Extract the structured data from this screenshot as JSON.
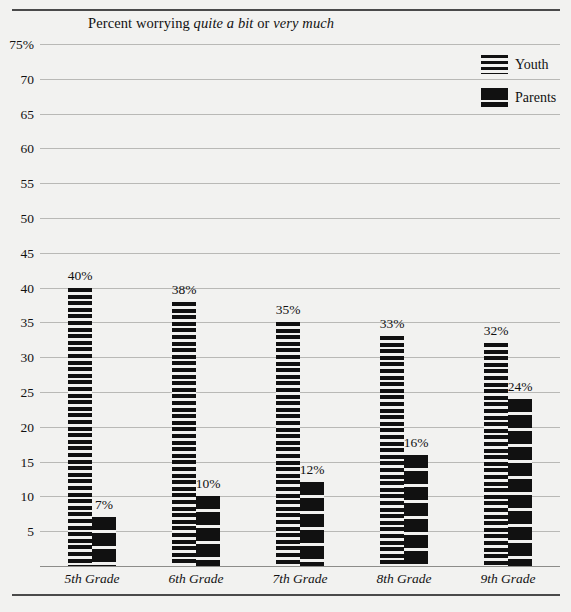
{
  "chart_data": {
    "type": "bar",
    "title": "Percent worrying quite a bit or very much",
    "title_parts": [
      {
        "text": "Percent worrying ",
        "italic": false
      },
      {
        "text": "quite a bit",
        "italic": true
      },
      {
        "text": " or ",
        "italic": false
      },
      {
        "text": "very much",
        "italic": true
      }
    ],
    "xlabel": "",
    "ylabel": "",
    "ylim": [
      0,
      75
    ],
    "grid": true,
    "legend_position": "top-right",
    "categories": [
      "5th Grade",
      "6th Grade",
      "7th Grade",
      "8th Grade",
      "9th Grade"
    ],
    "y_ticks": [
      "75%",
      "70",
      "65",
      "60",
      "55",
      "50",
      "45",
      "40",
      "35",
      "30",
      "25",
      "20",
      "15",
      "10",
      "5"
    ],
    "y_tick_values": [
      75,
      70,
      65,
      60,
      55,
      50,
      45,
      40,
      35,
      30,
      25,
      20,
      15,
      10,
      5
    ],
    "series": [
      {
        "name": "Youth",
        "pattern": "fine-horizontal-stripes",
        "values": [
          40,
          38,
          35,
          33,
          32
        ],
        "labels": [
          "40%",
          "38%",
          "35%",
          "33%",
          "32%"
        ]
      },
      {
        "name": "Parents",
        "pattern": "thick-horizontal-blocks",
        "values": [
          7,
          10,
          12,
          16,
          24
        ],
        "labels": [
          "7%",
          "10%",
          "12%",
          "16%",
          "24%"
        ]
      }
    ],
    "colors": {
      "ink": "#111111",
      "background": "#f2f2f0",
      "gridline": "#b9b9b6",
      "rule": "#4a4a4a"
    }
  },
  "legend": {
    "items": [
      {
        "label": "Youth"
      },
      {
        "label": "Parents"
      }
    ]
  }
}
